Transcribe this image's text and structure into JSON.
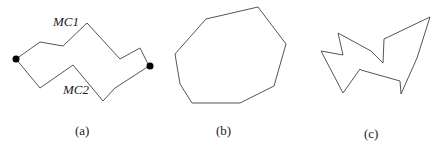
{
  "figure": {
    "panels": [
      {
        "caption": "(a)",
        "labels": {
          "top_path": "MC1",
          "bottom_path": "MC2"
        },
        "description": "Two monotone chains MC1 (upper) and MC2 (lower) connecting two endpoint dots"
      },
      {
        "caption": "(b)",
        "description": "Convex polygon"
      },
      {
        "caption": "(c)",
        "description": "Non-convex (concave) polygon"
      }
    ],
    "stroke_color": "#555555",
    "dot_color": "#000000"
  }
}
